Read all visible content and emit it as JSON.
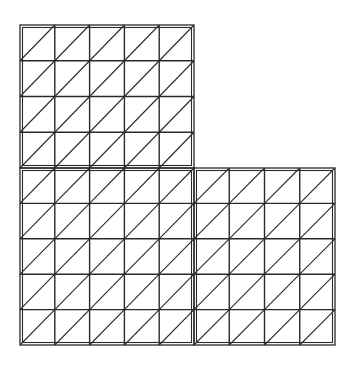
{
  "diagram": {
    "title": "",
    "stroke_color": "#2a2a2a",
    "background": "#ffffff",
    "blocks": [
      {
        "name": "top-left-block",
        "x": 20,
        "y": 25,
        "w": 174,
        "h": 143,
        "cols": 5,
        "rows": 4
      },
      {
        "name": "bottom-left-block",
        "x": 20,
        "y": 168,
        "w": 174,
        "h": 177,
        "cols": 5,
        "rows": 5
      },
      {
        "name": "bottom-right-block",
        "x": 194,
        "y": 168,
        "w": 141,
        "h": 177,
        "cols": 4,
        "rows": 5
      }
    ],
    "diagonal_direction": "bottom-left to top-right"
  }
}
